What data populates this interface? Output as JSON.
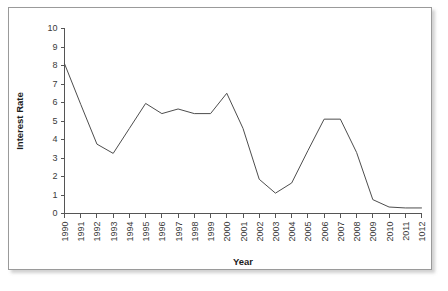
{
  "chart_data": {
    "type": "line",
    "title": "",
    "xlabel": "Year",
    "ylabel": "Interest Rate",
    "xlim": [
      0,
      22
    ],
    "ylim": [
      0,
      10
    ],
    "grid": false,
    "legend": false,
    "y_ticks": [
      "0",
      "1",
      "2",
      "3",
      "4",
      "5",
      "6",
      "7",
      "8",
      "9",
      "10"
    ],
    "categories": [
      "1990",
      "1991",
      "1992",
      "1993",
      "1994",
      "1995",
      "1996",
      "1997",
      "1998",
      "1999",
      "2000",
      "2001",
      "2002",
      "2003",
      "2004",
      "2005",
      "2006",
      "2007",
      "2008",
      "2009",
      "2010",
      "2011",
      "1012"
    ],
    "series": [
      {
        "name": "Interest Rate",
        "color": "#4d4d4d",
        "values": [
          8.1,
          5.9,
          3.75,
          3.25,
          4.6,
          5.95,
          5.4,
          5.65,
          5.4,
          5.4,
          6.5,
          4.6,
          1.85,
          1.1,
          1.65,
          3.4,
          5.1,
          5.1,
          3.3,
          0.75,
          0.35,
          0.3,
          0.3
        ]
      }
    ]
  },
  "axes": {
    "y_title": "Interest Rate",
    "x_title": "Year"
  }
}
